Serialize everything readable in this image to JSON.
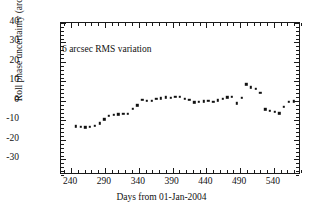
{
  "chart_data": {
    "type": "scatter",
    "title": "",
    "xlabel": "Days from 01-Jan-2004",
    "ylabel": "Roll phase uncertainty (arc sec)",
    "xlim": [
      225,
      580
    ],
    "ylim": [
      -38,
      40
    ],
    "xticks": [
      240,
      290,
      340,
      390,
      440,
      490,
      540
    ],
    "yticks": [
      40,
      30,
      20,
      10,
      0,
      -10,
      -20,
      -30
    ],
    "xtick_labels": [
      "240",
      "290",
      "340",
      "390",
      "440",
      "490",
      "540"
    ],
    "ytick_labels": [
      "40",
      "30",
      "20",
      "10",
      "0",
      "-10",
      "-20",
      "-30"
    ],
    "xminor_step": 10,
    "yminor_step": 2,
    "grid": false,
    "legend": null,
    "annotations": [
      {
        "text": "6 arcsec RMS variation",
        "x": 265,
        "y": 24
      }
    ],
    "marker": {
      "shape": "square",
      "size": 2.4,
      "color": "#111111"
    },
    "series": [
      {
        "name": "Roll phase uncertainty",
        "x": [
          247,
          254,
          261,
          268,
          275,
          282,
          289,
          296,
          303,
          310,
          317,
          324,
          331,
          338,
          345,
          352,
          359,
          366,
          373,
          380,
          387,
          394,
          401,
          408,
          415,
          422,
          429,
          436,
          443,
          450,
          457,
          464,
          471,
          478,
          485,
          492,
          499,
          506,
          513,
          520,
          527,
          534,
          541,
          548,
          555,
          562,
          569
        ],
        "y": [
          -13.0,
          -13.3,
          -13.5,
          -13.3,
          -12.6,
          -11.5,
          -9.5,
          -7.6,
          -7.0,
          -6.8,
          -6.6,
          -6.5,
          -4.0,
          -2.2,
          0.6,
          0.0,
          0.2,
          1.0,
          1.3,
          1.8,
          1.6,
          2.0,
          2.2,
          1.2,
          0.7,
          -0.6,
          -0.3,
          -0.2,
          0.0,
          -0.5,
          0.3,
          1.2,
          1.8,
          2.1,
          -1.2,
          1.7,
          8.5,
          7.0,
          6.3,
          4.1,
          -4.3,
          -5.0,
          -5.5,
          -6.3,
          -3.1,
          -0.5,
          -0.2
        ]
      }
    ]
  }
}
